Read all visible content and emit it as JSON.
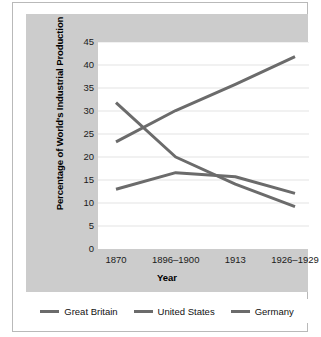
{
  "chart_data": {
    "type": "line",
    "title": "",
    "xlabel": "Year",
    "ylabel": "Percentage of World's Industrial Production",
    "categories": [
      "1870",
      "1896–1900",
      "1913",
      "1926–1929"
    ],
    "series": [
      {
        "name": "Great Britain",
        "values": [
          31.8,
          20.0,
          14.1,
          9.2
        ],
        "color": "#6b6b6b"
      },
      {
        "name": "United States",
        "values": [
          23.3,
          30.1,
          35.8,
          41.8
        ],
        "color": "#6b6b6b"
      },
      {
        "name": "Germany",
        "values": [
          13.0,
          16.6,
          15.7,
          12.1
        ],
        "color": "#6b6b6b"
      }
    ],
    "ylim": [
      0,
      45
    ],
    "yticks": [
      0,
      5,
      10,
      15,
      20,
      25,
      30,
      35,
      40,
      45
    ],
    "ytick_labels": [
      "0",
      "5",
      "10",
      "15",
      "20",
      "25",
      "30",
      "35",
      "40",
      "45"
    ],
    "grid": "horizontal",
    "legend_position": "bottom",
    "plot_background": "#ffffff",
    "panel_background": "#cccccc",
    "gridline_color": "#e3e3e3"
  },
  "legend": {
    "items": [
      {
        "label": "Great Britain",
        "swatch": "line-swatch"
      },
      {
        "label": "United States",
        "swatch": "line-swatch"
      },
      {
        "label": "Germany",
        "swatch": "line-swatch"
      }
    ]
  }
}
